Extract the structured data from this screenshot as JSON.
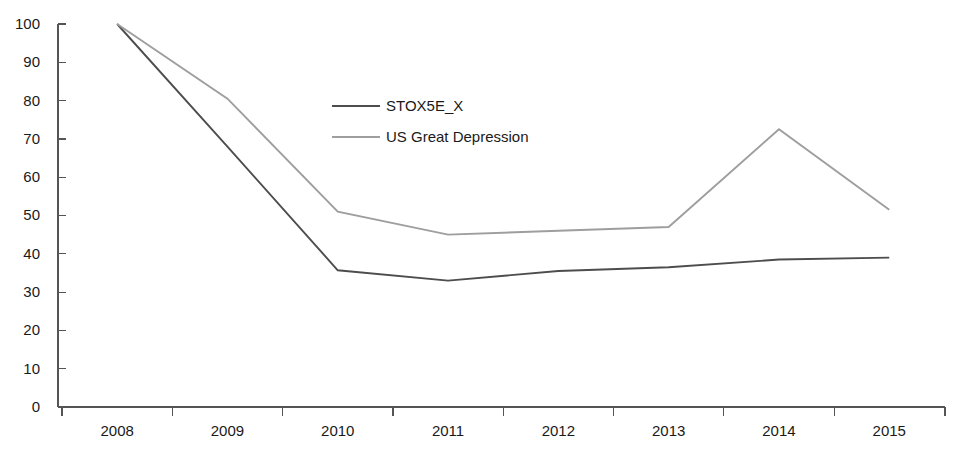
{
  "chart_data": {
    "type": "line",
    "title": "",
    "subtitle": "",
    "xlabel": "",
    "ylabel": "",
    "categories": [
      "2008",
      "2009",
      "2010",
      "2011",
      "2012",
      "2013",
      "2014",
      "2015"
    ],
    "ylim": [
      0,
      100
    ],
    "y_ticks": [
      0,
      10,
      20,
      30,
      40,
      50,
      60,
      70,
      80,
      90,
      100
    ],
    "y_tick_labels": [
      "0",
      "10",
      "20",
      "30",
      "40",
      "50",
      "60",
      "70",
      "80",
      "90",
      "100"
    ],
    "grid": false,
    "legend_position": "upper-center-left",
    "series": [
      {
        "name": "STOX5E_X",
        "color": "#4d4d4d",
        "values": [
          100,
          68,
          35.7,
          33,
          35.5,
          36.5,
          38.5,
          39
        ]
      },
      {
        "name": "US Great Depression",
        "color": "#9e9e9e",
        "values": [
          100,
          80.5,
          51,
          45,
          46,
          47,
          72.5,
          51.5
        ]
      }
    ],
    "legend": [
      {
        "label": "STOX5E_X",
        "color": "#4d4d4d"
      },
      {
        "label": "US Great Depression",
        "color": "#9e9e9e"
      }
    ],
    "axis_color": "#555555",
    "background_color": "#ffffff"
  }
}
